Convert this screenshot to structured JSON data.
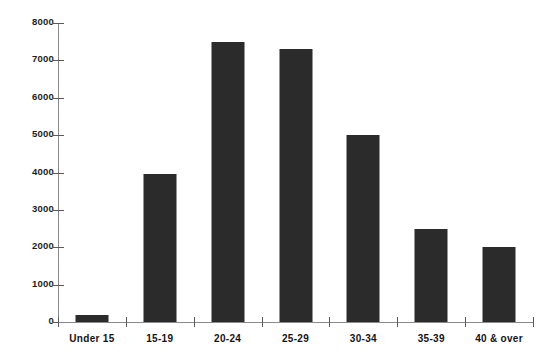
{
  "chart_data": {
    "type": "bar",
    "title": "",
    "subtitle": "",
    "xlabel": "",
    "ylabel": "",
    "categories": [
      "Under 15",
      "15-19",
      "20-24",
      "25-29",
      "30-34",
      "35-39",
      "40 & over"
    ],
    "values": [
      200,
      3950,
      7500,
      7300,
      5000,
      2500,
      2000
    ],
    "series": [
      {
        "name": "",
        "values": [
          200,
          3950,
          7500,
          7300,
          5000,
          2500,
          2000
        ]
      }
    ],
    "ylim": [
      0,
      8000
    ],
    "ytick_labels": [
      "0",
      "1000",
      "2000",
      "3000",
      "4000",
      "5000",
      "6000",
      "7000",
      "8000"
    ],
    "ytick_values": [
      0,
      1000,
      2000,
      3000,
      4000,
      5000,
      6000,
      7000,
      8000
    ],
    "grid": false,
    "legend": null,
    "legend_position": "none",
    "bar_color": "#2b2b2b",
    "axis_color": "#8a8a8a",
    "annotations": []
  }
}
